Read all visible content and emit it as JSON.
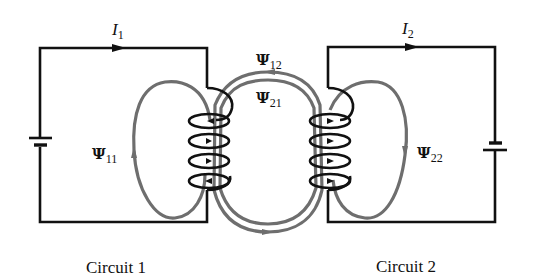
{
  "diagram": {
    "type": "mutually coupled circuits with flux linkages",
    "colors": {
      "wire": "#111111",
      "flux": "#6e6e6e",
      "background": "#ffffff"
    },
    "currents": [
      {
        "symbol": "I",
        "subscript": "1"
      },
      {
        "symbol": "I",
        "subscript": "2"
      }
    ],
    "flux_labels": [
      {
        "symbol": "Ψ",
        "subscript": "11"
      },
      {
        "symbol": "Ψ",
        "subscript": "12"
      },
      {
        "symbol": "Ψ",
        "subscript": "21"
      },
      {
        "symbol": "Ψ",
        "subscript": "22"
      }
    ],
    "captions": {
      "circuit1": "Circuit 1",
      "circuit2": "Circuit 2"
    },
    "icons": [
      "battery-icon",
      "coil-icon",
      "arrow-icon"
    ]
  }
}
